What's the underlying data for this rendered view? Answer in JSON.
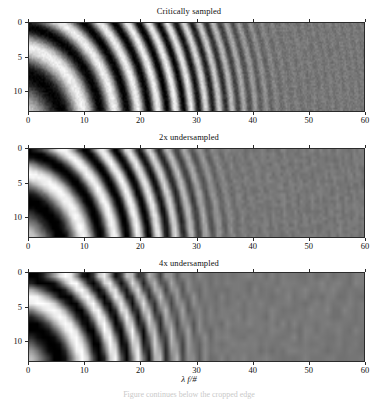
{
  "figure": {
    "background_color": "#ffffff",
    "foreground_color": "#111111",
    "axis_color": "#2b2b2b",
    "xlabel_lambda": "λ",
    "xlabel_rest": " f/#",
    "xlabel_full": "λ f/#",
    "bottom_caption_faint": "Figure continues below the cropped edge"
  },
  "chart_data": {
    "type": "heatmap",
    "xlabel": "λ f/#",
    "ylabel": "",
    "xlim": [
      0,
      60
    ],
    "ylim": [
      0,
      13
    ],
    "xticks": [
      0,
      10,
      20,
      30,
      40,
      50,
      60
    ],
    "xticklabels": [
      "0",
      "10",
      "20",
      "30",
      "40",
      "50",
      "60"
    ],
    "yticks": [
      0,
      5,
      10
    ],
    "yticklabels": [
      "0",
      "5",
      "10"
    ],
    "grid": false,
    "legend": "none",
    "colormap": "gray",
    "value_range": [
      0,
      1
    ],
    "panels": [
      {
        "id": "critically-sampled",
        "title": "Critically sampled",
        "sampling_factor": 1,
        "samples_per_unit": 4.0,
        "noise_amplitude": 0.05,
        "contrast_rolloff_start": 28,
        "contrast_rolloff_end": 52,
        "residual_contrast": 0.05,
        "mean_level": 0.47,
        "contrast": 0.47
      },
      {
        "id": "2x-undersampled",
        "title": "2x undersampled",
        "sampling_factor": 2,
        "samples_per_unit": 2.0,
        "noise_amplitude": 0.035,
        "contrast_rolloff_start": 22,
        "contrast_rolloff_end": 44,
        "residual_contrast": 0.04,
        "mean_level": 0.47,
        "contrast": 0.5
      },
      {
        "id": "4x-undersampled",
        "title": "4x undersampled",
        "sampling_factor": 4,
        "samples_per_unit": 1.0,
        "noise_amplitude": 0.03,
        "contrast_rolloff_start": 18,
        "contrast_rolloff_end": 40,
        "residual_contrast": 0.035,
        "mean_level": 0.47,
        "contrast": 0.55
      }
    ],
    "chirp": {
      "radial_chirp_coefficient": 0.0115,
      "x_origin": -3.0,
      "y_origin": 16.5,
      "phase_offset": 0.0
    },
    "geometry": {
      "plot_left": 28,
      "plot_right": 365,
      "panel_tops": [
        22,
        148,
        272
      ],
      "panel_height": 90,
      "title_tops": [
        6,
        132,
        258
      ],
      "xticklabel_tops": [
        115,
        241,
        365
      ],
      "xlabel_top": 374
    }
  }
}
